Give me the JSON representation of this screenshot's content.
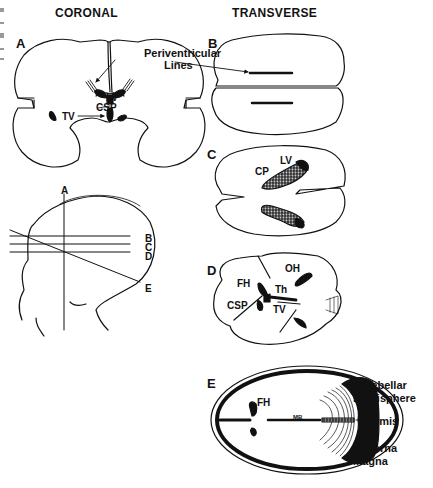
{
  "headers": {
    "coronal": "CORONAL",
    "transverse": "TRANSVERSE"
  },
  "panels": {
    "A": {
      "letter": "A",
      "labels": {
        "periventricular": "Periventricular",
        "lines": "Lines",
        "lv": "LV",
        "csp": "CSP",
        "tv": "TV"
      }
    },
    "B": {
      "letter": "B"
    },
    "C": {
      "letter": "C",
      "labels": {
        "lv": "LV",
        "cp": "CP"
      }
    },
    "D": {
      "letter": "D",
      "labels": {
        "oh": "OH",
        "fh": "FH",
        "th": "Th",
        "csp": "CSP",
        "tv": "TV"
      }
    },
    "E": {
      "letter": "E",
      "labels": {
        "fh": "FH",
        "mb": "MB",
        "cerebellar": "Cerebellar",
        "hemisphere": "Hemisphere",
        "vermis": "Vermis",
        "cisterna": "Cisterna",
        "magna": "Magna"
      }
    }
  },
  "head_diagram": {
    "planes": [
      "A",
      "B",
      "C",
      "D",
      "E"
    ]
  },
  "colors": {
    "ink": "#111111",
    "background": "#ffffff",
    "stipple": "#bdbdbd"
  }
}
